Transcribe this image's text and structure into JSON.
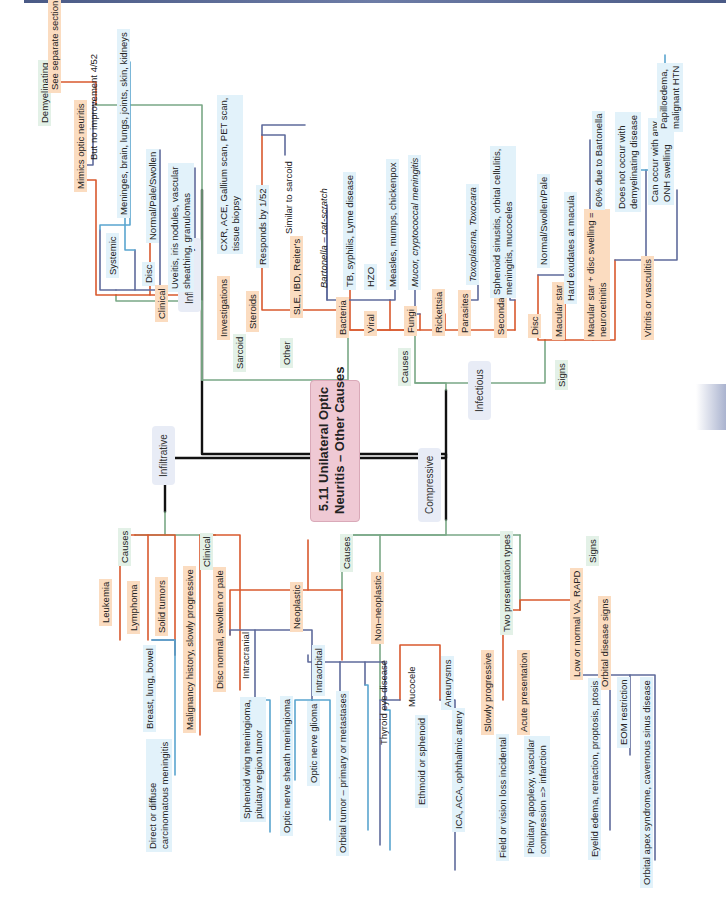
{
  "title": {
    "line1": "5.11 Unilateral Optic",
    "line2": "Neuritis – Other Causes"
  },
  "colors": {
    "level1": "#111111",
    "level2": "#7aa886",
    "level3": "#d9592e",
    "level4": "#5f6b9c",
    "level5": "#5aa5cf",
    "title_bg": "#efc9d4"
  },
  "categories": {
    "inflammatory": "Inflammatory",
    "infiltrative": "Infiltrative",
    "infectious": "Infectious",
    "compressive": "Compressive"
  },
  "inflammatory": {
    "demyelinating": "Demyelinating",
    "see_separate": "See separate section",
    "sarcoid": "Sarcoid",
    "mimics": "Mimics optic neuritis",
    "no_improvement": "But no improvement 4/52",
    "clinical": "Clinical",
    "systemic": "Systemic",
    "systemic_detail": "Meninges, brain, lungs, joints, skin, kidneys",
    "disc": "Disc",
    "disc_detail1": "Normal/Pale/Swollen",
    "disc_detail2a": "Uveitis, iris nodules, vascular",
    "disc_detail2b": "sheathing, granulomas",
    "investigations": "Investigations",
    "investigations_detail_a": "CXR, ACE, Gallium scan, PET scan,",
    "investigations_detail_b": "tissue biopsy",
    "steroids": "Steroids",
    "steroids_detail": "Responds by 1/52",
    "other": "Other",
    "other_detail": "SLE, IBD, Reiter's",
    "other_sub": "Similar to sarcoid"
  },
  "infectious": {
    "causes": "Causes",
    "bacteria": "Bacteria",
    "bacteria_d1": "Bartonella – cat-scratch",
    "bacteria_d2": "TB, syphilis, Lyme disease",
    "viral": "Viral",
    "viral_d1": "HZO",
    "viral_d2": "Measles, mumps, chickenpox",
    "fungi": "Fungi",
    "fungi_d1": "Mucor, cryptococcal meningitis",
    "rickettsia": "Rickettsia",
    "parasites": "Parasites",
    "parasites_d1": "Toxoplasma, Toxocara",
    "secondary": "Secondary",
    "secondary_d_a": "Sphenoid sinusitis, orbital cellulitis,",
    "secondary_d_b": "meningitis, mucoceles",
    "signs": "Signs",
    "disc": "Disc",
    "disc_d1": "Normal/Swollen/Pale",
    "macular_star": "Macular star",
    "macular_star_d1": "Hard exudates at macula",
    "neuroretinitis_a": "Macular star + disc swelling =",
    "neuroretinitis_b": "neuroretinitis",
    "neuro_d1": "60% due to Bartonella",
    "neuro_d2a": "Does not occur with",
    "neuro_d2b": "demyelinating disease",
    "neuro_d3a": "Can occur with any",
    "neuro_d3b": "ONH swelling",
    "neuro_d3_sub_a": "Papilloedema,",
    "neuro_d3_sub_b": "malignant HTN",
    "vitritis": "Vitritis or vasculitis"
  },
  "infiltrative": {
    "causes": "Causes",
    "leukemia": "Leukemia",
    "lymphoma": "Lymphoma",
    "solid_tumors": "Solid tumors",
    "solid_d1": "Breast, lung, bowel",
    "solid_d2a": "Direct or diffuse",
    "solid_d2b": "carcinomatous meningitis",
    "clinical": "Clinical",
    "malignancy": "Malignancy history, slowly progressive",
    "disc": "Disc normal, swollen or pale"
  },
  "compressive": {
    "causes": "Causes",
    "neoplastic": "Neoplastic",
    "intracranial": "Intracranial",
    "intracranial_d1a": "Sphenoid wing meningioma,",
    "intracranial_d1b": "pituitary region tumor",
    "intracranial_d2": "Optic nerve sheath meningioma",
    "intraorbital": "Intraorbital",
    "intraorbital_d1": "Optic nerve glioma",
    "intraorbital_d2": "Orbital tumor – primary or metastases",
    "non_neoplastic": "Non–neoplastic",
    "thyroid": "Thyroid eye disease",
    "mucocele": "Mucocele",
    "mucocele_d1": "Ethmoid or sphenoid",
    "aneurysms": "Aneurysms",
    "aneurysms_d1": "ICA, ACA, ophthalmic artery",
    "two_types": "Two presentation types",
    "slowly": "Slowly progressive",
    "slowly_d1": "Field or vision loss incidental",
    "acute": "Acute presentation",
    "acute_d1a": "Pituitary apoplexy, vascular",
    "acute_d1b": "compression => infarction",
    "signs": "Signs",
    "low_va": "Low or normal VA, RAPD",
    "orbital_signs": "Orbital disease signs",
    "orbital_d1": "Eyelid edema, retraction, proptosis, ptosis",
    "orbital_d2": "EOM restriction",
    "orbital_d3": "Orbital apex syndrome, cavernous sinus disease"
  }
}
